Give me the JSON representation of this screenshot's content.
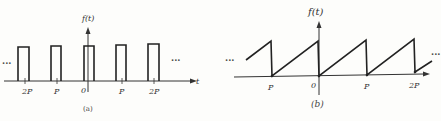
{
  "figures": [
    {
      "id": "a",
      "caption": "(a)",
      "y_axis_label": "f(t)",
      "x_axis_label": "t",
      "ellipsis_left": "···",
      "ellipsis_right": "···",
      "tick_labels": [
        "2P",
        "P",
        "0",
        "P",
        "2P"
      ],
      "waveform": "rectangular pulse train"
    },
    {
      "id": "b",
      "caption": "(b)",
      "y_axis_label": "f(t)",
      "ellipsis_left": "···",
      "ellipsis_right": "···",
      "tick_labels": [
        "P",
        "0",
        "P",
        "2P"
      ],
      "waveform": "sawtooth"
    }
  ],
  "colors": {
    "ink": "#222222",
    "background": "#fdfdfb"
  }
}
